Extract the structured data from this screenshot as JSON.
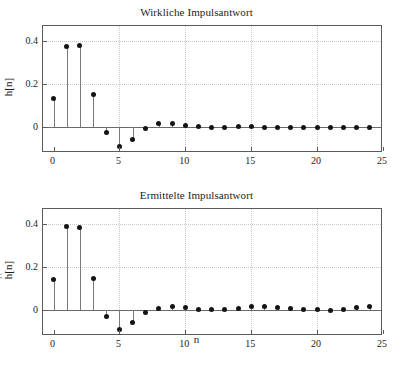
{
  "figure": {
    "background_color": "#ffffff",
    "axis_color": "#5b5b5b",
    "marker_color": "#141414",
    "grid_color": "#c9c9c9",
    "xlabel": "n"
  },
  "chart_data": [
    {
      "type": "scatter",
      "plot_style": "stem",
      "title": "Wirkliche Impulsantwort",
      "xlabel": "",
      "ylabel": "h[n]",
      "xlim": [
        -0.8,
        25
      ],
      "ylim": [
        -0.12,
        0.47
      ],
      "xticks": [
        0,
        5,
        10,
        15,
        20,
        25
      ],
      "xticklabels": [
        "0",
        "5",
        "10",
        "15",
        "20",
        "25"
      ],
      "yticks": [
        0,
        0.2,
        0.4
      ],
      "yticklabels": [
        "0",
        "0.2",
        "0.4"
      ],
      "grid": true,
      "legend": null,
      "x": [
        0,
        1,
        2,
        3,
        4,
        5,
        6,
        7,
        8,
        9,
        10,
        11,
        12,
        13,
        14,
        15,
        16,
        17,
        18,
        19,
        20,
        21,
        22,
        23,
        24
      ],
      "values": [
        0.133,
        0.373,
        0.378,
        0.154,
        -0.026,
        -0.088,
        -0.056,
        -0.008,
        0.015,
        0.016,
        0.008,
        0.001,
        -0.001,
        0.0,
        0.001,
        0.001,
        0.0,
        0.0,
        0.0,
        0.0,
        0.0,
        0.0,
        0.0,
        0.0,
        0.0
      ]
    },
    {
      "type": "scatter",
      "plot_style": "stem",
      "title": "Ermittelte Impulsantwort",
      "xlabel": "n",
      "ylabel": "ĥ[n]",
      "xlim": [
        -0.8,
        25
      ],
      "ylim": [
        -0.12,
        0.47
      ],
      "xticks": [
        0,
        5,
        10,
        15,
        20,
        25
      ],
      "xticklabels": [
        "0",
        "5",
        "10",
        "15",
        "20",
        "25"
      ],
      "yticks": [
        0,
        0.2,
        0.4
      ],
      "yticklabels": [
        "0",
        "0.2",
        "0.4"
      ],
      "grid": true,
      "legend": null,
      "x": [
        0,
        1,
        2,
        3,
        4,
        5,
        6,
        7,
        8,
        9,
        10,
        11,
        12,
        13,
        14,
        15,
        16,
        17,
        18,
        19,
        20,
        21,
        22,
        23,
        24
      ],
      "values": [
        0.142,
        0.388,
        0.383,
        0.145,
        -0.031,
        -0.089,
        -0.059,
        -0.013,
        0.009,
        0.017,
        0.013,
        0.005,
        0.002,
        0.003,
        0.01,
        0.017,
        0.016,
        0.012,
        0.009,
        0.004,
        0.001,
        -0.001,
        0.004,
        0.013,
        0.016
      ]
    }
  ]
}
